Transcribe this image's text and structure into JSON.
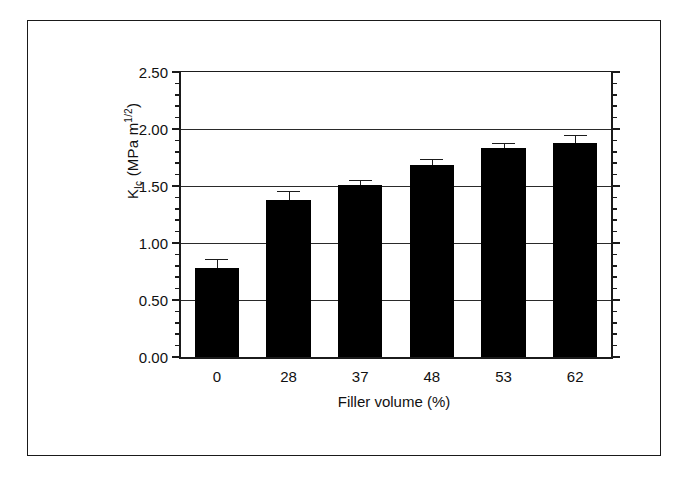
{
  "figure": {
    "border_color": "#1a1a1a",
    "background": "#ffffff"
  },
  "chart_data": {
    "type": "bar",
    "title": "",
    "xlabel": "Filler volume (%)",
    "ylabel": "K_Ic (MPa m^1/2)",
    "ylabel_parts": {
      "symbol": "K",
      "subscript": "Ic",
      "units_prefix": " (MPa m",
      "units_superscript": "1/2",
      "units_suffix": ")"
    },
    "categories": [
      "0",
      "28",
      "37",
      "48",
      "53",
      "62"
    ],
    "values": [
      0.78,
      1.38,
      1.51,
      1.68,
      1.83,
      1.88
    ],
    "errors": [
      0.08,
      0.08,
      0.04,
      0.06,
      0.05,
      0.07
    ],
    "bar_color": "#000000",
    "ylim": [
      0.0,
      2.5
    ],
    "ytick_labels": [
      "0.00",
      "0.50",
      "1.00",
      "1.50",
      "2.00",
      "2.50"
    ],
    "ytick_values": [
      0.0,
      0.5,
      1.0,
      1.5,
      2.0,
      2.5
    ],
    "yminor_step": 0.1,
    "grid": "horizontal",
    "legend": "none"
  }
}
